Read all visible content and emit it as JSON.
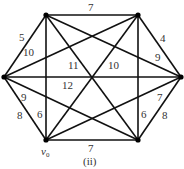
{
  "diagram": {
    "type": "weighted-complete-graph",
    "caption": "(ii)",
    "start_vertex_label": "v",
    "start_vertex_subscript": "0",
    "vertices": [
      {
        "id": "TL",
        "x": 46,
        "y": 15
      },
      {
        "id": "TR",
        "x": 138,
        "y": 15
      },
      {
        "id": "L",
        "x": 4,
        "y": 77
      },
      {
        "id": "R",
        "x": 181,
        "y": 77
      },
      {
        "id": "BL",
        "x": 46,
        "y": 140
      },
      {
        "id": "BR",
        "x": 138,
        "y": 140
      }
    ],
    "edges": [
      {
        "from": "TL",
        "to": "TR",
        "weight": "7"
      },
      {
        "from": "L",
        "to": "TL",
        "weight": "5"
      },
      {
        "from": "TR",
        "to": "R",
        "weight": "4"
      },
      {
        "from": "L",
        "to": "BL",
        "weight": "8"
      },
      {
        "from": "R",
        "to": "BR",
        "weight": "8"
      },
      {
        "from": "BL",
        "to": "BR",
        "weight": "7"
      },
      {
        "from": "L",
        "to": "TR",
        "weight": "10"
      },
      {
        "from": "TL",
        "to": "R",
        "weight": "9"
      },
      {
        "from": "L",
        "to": "BR",
        "weight": "9"
      },
      {
        "from": "BL",
        "to": "R",
        "weight": "7"
      },
      {
        "from": "TL",
        "to": "BR",
        "weight": "11"
      },
      {
        "from": "TR",
        "to": "BL",
        "weight": "10"
      },
      {
        "from": "L",
        "to": "R",
        "weight": "12"
      },
      {
        "from": "TL",
        "to": "BL",
        "weight": "6"
      },
      {
        "from": "TR",
        "to": "BR",
        "weight": "6"
      }
    ]
  }
}
